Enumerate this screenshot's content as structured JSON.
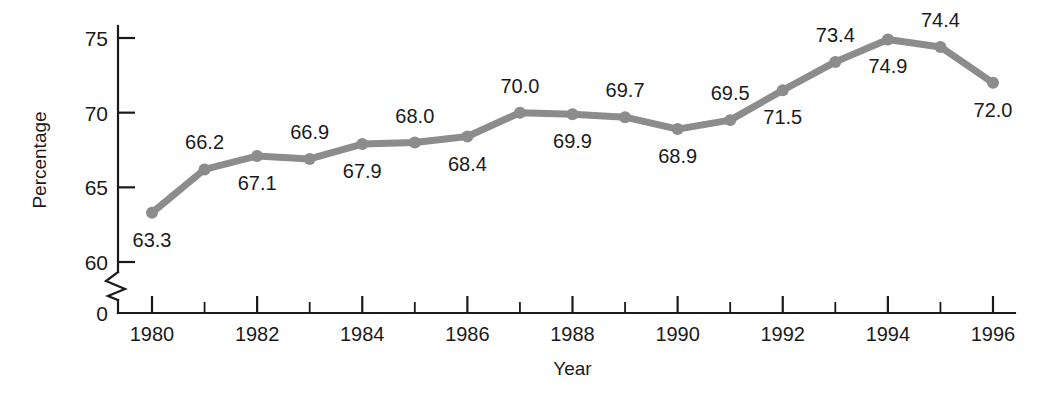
{
  "chart_data": {
    "type": "line",
    "title": "",
    "xlabel": "Year",
    "ylabel": "Percentage",
    "grid": false,
    "legend": "none",
    "x": [
      1980,
      1981,
      1982,
      1983,
      1984,
      1985,
      1986,
      1987,
      1988,
      1989,
      1990,
      1991,
      1992,
      1993,
      1994,
      1995,
      1996
    ],
    "values": [
      63.3,
      66.2,
      67.1,
      66.9,
      67.9,
      68.0,
      68.4,
      70.0,
      69.9,
      69.7,
      68.9,
      69.5,
      71.5,
      73.4,
      74.9,
      74.4,
      72.0
    ],
    "point_labels": [
      "63.3",
      "66.2",
      "67.1",
      "66.9",
      "67.9",
      "68.0",
      "68.4",
      "70.0",
      "69.9",
      "69.7",
      "68.9",
      "69.5",
      "71.5",
      "73.4",
      "74.9",
      "74.4",
      "72.0"
    ],
    "label_positions": [
      "below",
      "above",
      "below",
      "above",
      "below",
      "above",
      "below",
      "above",
      "below",
      "above",
      "below",
      "above",
      "below",
      "above",
      "below",
      "above",
      "below"
    ],
    "xlim": [
      1979.4,
      1996.6
    ],
    "ylim": [
      60,
      76.2
    ],
    "y_ticks": [
      60,
      65,
      70,
      75
    ],
    "y_tick_labels": [
      "60",
      "65",
      "70",
      "75"
    ],
    "y_zero_label": "0",
    "x_ticks": [
      1980,
      1981,
      1982,
      1983,
      1984,
      1985,
      1986,
      1987,
      1988,
      1989,
      1990,
      1991,
      1992,
      1993,
      1994,
      1995,
      1996
    ],
    "x_tick_labels": [
      "1980",
      "",
      "1982",
      "",
      "1984",
      "",
      "1986",
      "",
      "1988",
      "",
      "1990",
      "",
      "1992",
      "",
      "1994",
      "",
      "1996"
    ],
    "axis_break": true,
    "series_color": "#8c8c8c",
    "axis_color": "#1a1a1a",
    "background_color": "#ffffff"
  }
}
